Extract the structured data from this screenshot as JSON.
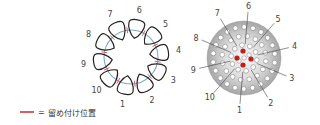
{
  "figure": {
    "left_diagram": {
      "description": "Ten teardrop loops arranged in a ring with attachment marks",
      "loop_labels": [
        "1",
        "2",
        "3",
        "4",
        "5",
        "6",
        "7",
        "8",
        "9",
        "10"
      ],
      "center": [
        131,
        57
      ],
      "ring_radius": 27,
      "loop_color": "#222222",
      "ring_color": "#7fa8c8",
      "mark_color": "#d9605a"
    },
    "right_diagram": {
      "description": "Gray disc with holes and red center points, numbered positions",
      "labels": [
        "1",
        "2",
        "3",
        "4",
        "5",
        "6",
        "7",
        "8",
        "9",
        "10"
      ],
      "center": [
        244,
        58
      ],
      "radius": 37,
      "disc_color_outer": "#a9a9a9",
      "disc_color_inner": "#f4f4f4",
      "hole_color": "#ffffff",
      "red_dot_color": "#c0201a",
      "leader_color": "#444444"
    }
  },
  "legend": {
    "swatch_color": "#d9605a",
    "equals": "=",
    "label": "留め付け位置"
  }
}
